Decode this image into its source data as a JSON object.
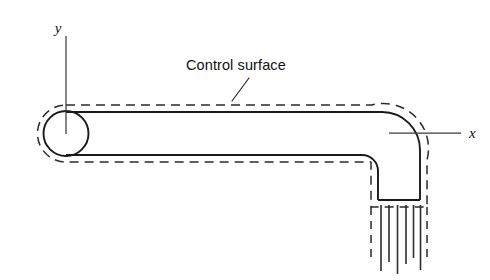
{
  "figure": {
    "background_color": "#ffffff",
    "line_color": "#1a1a1a",
    "width": 490,
    "height": 280
  },
  "annotations": {
    "control_surface_label": "Control surface",
    "y_axis_label": "y",
    "x_axis_label": "x"
  },
  "geometry": {
    "pipe": {
      "description": "horizontal run turning through a 90 degree elbow into a downward vertical run",
      "horizontal_top_wall_y": 112,
      "horizontal_bottom_wall_y": 155,
      "vertical_inner_wall_x": 378,
      "vertical_outer_wall_x": 420,
      "pipe_bottom_y": 200,
      "elbow_outer_radius": 38,
      "elbow_inner_radius": 16
    },
    "inlet_circle": {
      "center_x": 66,
      "center_y": 133,
      "radius": 22.5
    },
    "control_surface": {
      "offset": 7,
      "style": "dashed",
      "left_cap": "rounded"
    },
    "jet_streamlines": {
      "count": 6,
      "top_y": 204,
      "positions_x": [
        381,
        389,
        397,
        405,
        413,
        420
      ],
      "bottom_y": [
        272,
        266,
        274,
        268,
        262,
        272
      ]
    },
    "y_axis": {
      "x": 66,
      "top_y": 36,
      "bottom_y": 134
    },
    "x_axis": {
      "y": 133,
      "left_x": 389,
      "right_x": 461
    },
    "leader": {
      "from_x": 248,
      "from_y": 78,
      "to_x": 232,
      "to_y": 100
    }
  }
}
